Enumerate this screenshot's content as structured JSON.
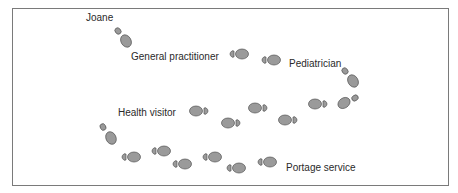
{
  "diagram": {
    "title": "",
    "colors": {
      "border": "#7a7a7a",
      "footprint_fill": "#9a9a9a",
      "footprint_stroke": "#555555",
      "text": "#2a2a2a"
    },
    "labels": [
      {
        "id": "joane",
        "text": "Joane",
        "x": 86,
        "y": 15
      },
      {
        "id": "gp",
        "text": "General practitioner",
        "x": 131,
        "y": 52
      },
      {
        "id": "pediatrician",
        "text": "Pediatrician",
        "x": 289,
        "y": 59
      },
      {
        "id": "health-visitor",
        "text": "Health visitor",
        "x": 118,
        "y": 110
      },
      {
        "id": "portage",
        "text": "Portage service",
        "x": 286,
        "y": 163
      }
    ],
    "footprints": [
      {
        "x": 118,
        "y": 30,
        "rot": 50,
        "dir": "down"
      },
      {
        "x": 125,
        "y": 39,
        "rot": 60,
        "dir": "down"
      },
      {
        "x": 228,
        "y": 54,
        "rot": 0,
        "dir": "right"
      },
      {
        "x": 265,
        "y": 60,
        "rot": 0,
        "dir": "right"
      },
      {
        "x": 345,
        "y": 72,
        "rot": 50,
        "dir": "down"
      },
      {
        "x": 353,
        "y": 81,
        "rot": 60,
        "dir": "down"
      },
      {
        "x": 343,
        "y": 101,
        "rot": -35,
        "dir": "up-right"
      },
      {
        "x": 307,
        "y": 104,
        "rot": 0,
        "dir": "right-rev"
      },
      {
        "x": 280,
        "y": 120,
        "rot": 0,
        "dir": "right-rev"
      },
      {
        "x": 249,
        "y": 108,
        "rot": 0,
        "dir": "right-rev"
      },
      {
        "x": 222,
        "y": 122,
        "rot": 0,
        "dir": "right-rev"
      },
      {
        "x": 192,
        "y": 111,
        "rot": 0,
        "dir": "right-rev"
      },
      {
        "x": 103,
        "y": 127,
        "rot": 60,
        "dir": "down"
      },
      {
        "x": 110,
        "y": 136,
        "rot": 65,
        "dir": "down"
      },
      {
        "x": 129,
        "y": 157,
        "rot": 0,
        "dir": "right"
      },
      {
        "x": 159,
        "y": 152,
        "rot": 0,
        "dir": "right"
      },
      {
        "x": 181,
        "y": 164,
        "rot": 0,
        "dir": "right"
      },
      {
        "x": 210,
        "y": 158,
        "rot": 0,
        "dir": "right"
      },
      {
        "x": 238,
        "y": 168,
        "rot": 0,
        "dir": "right"
      },
      {
        "x": 268,
        "y": 162,
        "rot": 0,
        "dir": "right"
      }
    ]
  }
}
